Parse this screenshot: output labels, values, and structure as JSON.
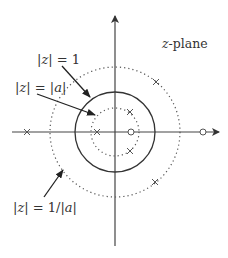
{
  "diagram": {
    "title": "z-plane",
    "title_var": "z",
    "title_rest": "-plane",
    "labels": {
      "unit_circle": {
        "text": "|z| = 1",
        "parts": [
          "|",
          "z",
          "| = 1"
        ]
      },
      "inner_circle": {
        "text": "|z| = |a|",
        "parts": [
          "|",
          "z",
          "| = |",
          "a",
          "|"
        ]
      },
      "outer_circle": {
        "text": "|z| = 1/|a|",
        "parts": [
          "|",
          "z",
          "| = 1/|",
          "a",
          "|"
        ]
      }
    },
    "circles": [
      {
        "name": "unit-circle",
        "radius_label": "1",
        "style": "solid"
      },
      {
        "name": "inner-circle",
        "radius_label": "|a|",
        "style": "dotted"
      },
      {
        "name": "outer-circle",
        "radius_label": "1/|a|",
        "style": "dotted"
      }
    ],
    "poles_count": 5,
    "zeros_count": 2,
    "colors": {
      "stroke": "#333333",
      "background": "#ffffff"
    }
  }
}
